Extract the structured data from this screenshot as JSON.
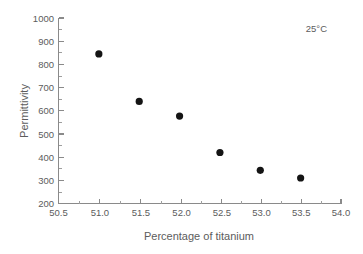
{
  "chart_data": {
    "type": "scatter",
    "title": "",
    "xlabel": "Percentage of titanium",
    "ylabel": "Permittivity",
    "xlim": [
      50.5,
      54.0
    ],
    "ylim": [
      200,
      1000
    ],
    "grid": false,
    "legend": null,
    "x": [
      51.0,
      51.5,
      52.0,
      52.5,
      53.0,
      53.5
    ],
    "values": [
      845,
      640,
      577,
      420,
      343,
      310
    ],
    "series": [
      {
        "name": "Permittivity at 25°C",
        "marker": "filled-circle",
        "color": "#141414",
        "points": [
          {
            "x": 51.0,
            "y": 845
          },
          {
            "x": 51.5,
            "y": 640
          },
          {
            "x": 52.0,
            "y": 577
          },
          {
            "x": 52.5,
            "y": 420
          },
          {
            "x": 53.0,
            "y": 343
          },
          {
            "x": 53.5,
            "y": 310
          }
        ]
      }
    ],
    "xticks": [
      50.5,
      51.0,
      51.5,
      52.0,
      52.5,
      53.0,
      53.5,
      54.0
    ],
    "xticklabels": [
      "50.5",
      "51.0",
      "51.5",
      "52.0",
      "52.5",
      "53.0",
      "53.5",
      "54.0"
    ],
    "yticks": [
      200,
      300,
      400,
      500,
      600,
      700,
      800,
      900,
      1000
    ],
    "yticklabels": [
      "200",
      "300",
      "400",
      "500",
      "600",
      "700",
      "800",
      "900",
      "1000"
    ],
    "annotations": [
      {
        "text": "25°C",
        "x": 53.85,
        "y": 960,
        "position": "top-right"
      }
    ]
  },
  "colors": {
    "marker": "#141414",
    "axis": "#8a8a8a",
    "text": "#5c5c5c",
    "background": "#ffffff"
  }
}
